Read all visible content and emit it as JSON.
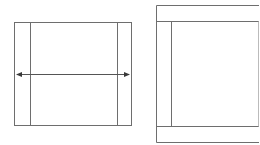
{
  "diagram": {
    "stroke_color": "#6e6e6e",
    "background": "#ffffff",
    "left_panel": {
      "description": "box with two inner vertical margins and a horizontal double-headed arrow spanning full width",
      "outer": {
        "x": 14,
        "y": 22,
        "w": 118,
        "h": 104
      },
      "inner_lines_x": [
        30,
        117
      ],
      "arrow": {
        "x1": 15,
        "x2": 131,
        "y": 74,
        "double_headed": true
      }
    },
    "right_panel": {
      "description": "box with top and bottom horizontal bands and a left inner vertical margin, cropped on the right",
      "outer": {
        "x": 156,
        "y": 5,
        "w": 103,
        "h": 137
      },
      "inner_lines_y": [
        21,
        126
      ],
      "inner_line_x": 171
    }
  }
}
